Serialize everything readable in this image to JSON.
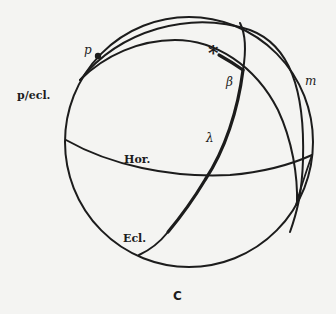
{
  "figure": {
    "caption": "C",
    "colors": {
      "ink": "#1c1c1c",
      "paper": "#f4f4f2"
    },
    "labels": {
      "pole": "p",
      "pole_of_ecliptic": "p/ecl.",
      "star": "*",
      "latitude": "β",
      "longitude": "λ",
      "meridian": "m",
      "horizon": "Hor.",
      "ecliptic": "Ecl."
    }
  }
}
